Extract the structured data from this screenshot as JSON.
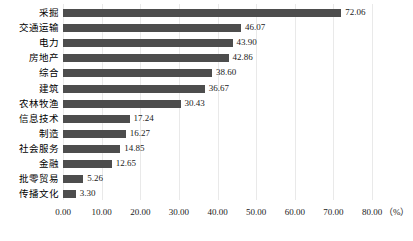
{
  "chart_data": {
    "type": "bar",
    "orientation": "horizontal",
    "title": "",
    "xlabel": "（%）",
    "ylabel": "",
    "xlim": [
      0,
      80
    ],
    "xticks": [
      "0.00",
      "10.00",
      "20.00",
      "30.00",
      "40.00",
      "50.00",
      "60.00",
      "70.00",
      "80.00"
    ],
    "xtick_values": [
      0,
      10,
      20,
      30,
      40,
      50,
      60,
      70,
      80
    ],
    "grid": true,
    "legend": false,
    "bar_color": "#4d4d4d",
    "grid_color": "#e9e9e9",
    "categories": [
      "采掘",
      "交通运输",
      "电力",
      "房地产",
      "综合",
      "建筑",
      "农林牧渔",
      "信息技术",
      "制造",
      "社会服务",
      "金融",
      "批零贸易",
      "传播文化"
    ],
    "values": [
      72.06,
      46.07,
      43.9,
      42.86,
      38.6,
      36.67,
      30.43,
      17.24,
      16.27,
      14.85,
      12.65,
      5.26,
      3.3
    ],
    "value_labels": [
      "72.06",
      "46.07",
      "43.90",
      "42.86",
      "38.60",
      "36.67",
      "30.43",
      "17.24",
      "16.27",
      "14.85",
      "12.65",
      "5.26",
      "3.30"
    ]
  }
}
